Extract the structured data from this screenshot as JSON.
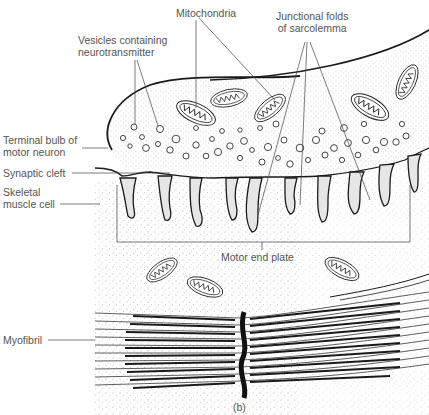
{
  "figure": {
    "panel_label": "(b)",
    "labels": {
      "vesicles": [
        "Vesicles containing",
        "neurotransmitter"
      ],
      "mitochondria": "Mitochondria",
      "junctional_folds": [
        "Junctional folds",
        "of sarcolemma"
      ],
      "terminal_bulb": [
        "Terminal bulb of",
        "motor neuron"
      ],
      "synaptic_cleft": "Synaptic cleft",
      "skeletal_muscle": [
        "Skeletal",
        "muscle cell"
      ],
      "motor_end_plate": "Motor end plate",
      "myofibril": "Myofibril"
    }
  },
  "colors": {
    "ink": "#1a1a1a",
    "label_text": "#555555",
    "leader_line": "#444444",
    "stipple": "#b0b0b0",
    "background": "#ffffff"
  }
}
